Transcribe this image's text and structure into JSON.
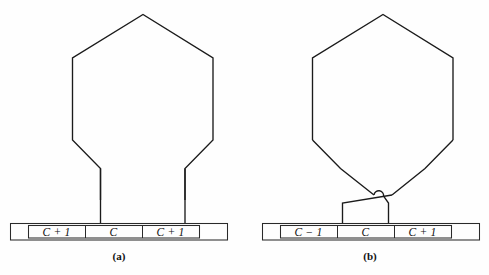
{
  "figure": {
    "background_color": "#fefefe",
    "line_color": "#1b1b1b",
    "text_color": "#111111",
    "panels": [
      {
        "id": "a",
        "caption": "(a)",
        "shape_name": "hexagon-with-two-straight-legs",
        "tape": {
          "cells": [
            {
              "label": "C + 1"
            },
            {
              "label": "C"
            },
            {
              "label": "C + 1"
            }
          ]
        }
      },
      {
        "id": "b",
        "caption": "(b)",
        "shape_name": "hexagon-with-crossed-legs",
        "tape": {
          "cells": [
            {
              "label": "C − 1"
            },
            {
              "label": "C"
            },
            {
              "label": "C + 1"
            }
          ]
        }
      }
    ]
  }
}
